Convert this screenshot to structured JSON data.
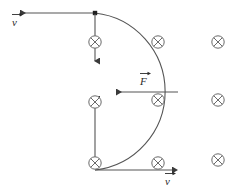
{
  "figure": {
    "kind": "physics-diagram",
    "background_color": "#ffffff",
    "stroke_color": "#4a4a4a",
    "text_color": "#2b2b2b",
    "labels": {
      "velocity_top": "v",
      "velocity_bottom": "v",
      "force": "F"
    },
    "field_symbol": {
      "name": "magnetic-field-into-page",
      "glyph": "circle-with-cross",
      "count": 8
    },
    "field_markers": [
      {
        "id": "field-marker-1",
        "x": 95,
        "y": 42
      },
      {
        "id": "field-marker-2",
        "x": 158,
        "y": 42
      },
      {
        "id": "field-marker-3",
        "x": 218,
        "y": 42
      },
      {
        "id": "field-marker-4",
        "x": 95,
        "y": 102
      },
      {
        "id": "field-marker-5",
        "x": 158,
        "y": 100
      },
      {
        "id": "field-marker-6",
        "x": 218,
        "y": 100
      },
      {
        "id": "field-marker-7",
        "x": 95,
        "y": 163
      },
      {
        "id": "field-marker-8",
        "x": 158,
        "y": 163
      },
      {
        "id": "field-marker-9",
        "x": 218,
        "y": 160
      }
    ],
    "geometry": {
      "entry_point": {
        "x": 95,
        "y": 13
      },
      "exit_point": {
        "x": 95,
        "y": 170
      },
      "arc_apex": {
        "x": 178,
        "y": 92
      },
      "radius": 79
    }
  }
}
